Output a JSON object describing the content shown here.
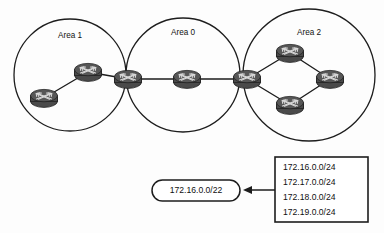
{
  "diagram": {
    "type": "network-topology",
    "title_visible": false,
    "background_color": "#fdfdfd",
    "line_color": "#1d1d1d",
    "router_color": "#4a4a4a",
    "areas": [
      {
        "id": "area-1",
        "label": "Area 1",
        "label_x": 70,
        "label_y": 36,
        "cx": 70,
        "cy": 75,
        "r": 56
      },
      {
        "id": "area-0",
        "label": "Area 0",
        "label_x": 183,
        "label_y": 33,
        "cx": 183,
        "cy": 75,
        "r": 57
      },
      {
        "id": "area-2",
        "label": "Area 2",
        "label_x": 309,
        "label_y": 33,
        "cx": 309,
        "cy": 75,
        "r": 66
      }
    ],
    "routers": [
      {
        "id": "r-a1-internal-bottom",
        "area": "Area 1",
        "x": 44,
        "y": 98
      },
      {
        "id": "r-a1-internal-top",
        "area": "Area 1",
        "x": 88,
        "y": 72
      },
      {
        "id": "r-abr-1",
        "area": "Area 1 / Area 0 border",
        "x": 128,
        "y": 79
      },
      {
        "id": "r-a0-backbone",
        "area": "Area 0",
        "x": 187,
        "y": 79
      },
      {
        "id": "r-abr-2",
        "area": "Area 0 / Area 2 border",
        "x": 247,
        "y": 79
      },
      {
        "id": "r-a2-top",
        "area": "Area 2",
        "x": 290,
        "y": 53
      },
      {
        "id": "r-a2-right",
        "area": "Area 2",
        "x": 330,
        "y": 79
      },
      {
        "id": "r-a2-bottom",
        "area": "Area 2",
        "x": 290,
        "y": 105
      }
    ],
    "links": [
      {
        "id": "link-a1-bottom-top",
        "from": "r-a1-internal-bottom",
        "to": "r-a1-internal-top"
      },
      {
        "id": "link-a1-top-abr1",
        "from": "r-a1-internal-top",
        "to": "r-abr-1"
      },
      {
        "id": "link-abr1-backbone",
        "from": "r-abr-1",
        "to": "r-a0-backbone"
      },
      {
        "id": "link-backbone-abr2",
        "from": "r-a0-backbone",
        "to": "r-abr-2"
      },
      {
        "id": "link-abr2-a2top",
        "from": "r-abr-2",
        "to": "r-a2-top"
      },
      {
        "id": "link-abr2-a2bottom",
        "from": "r-abr-2",
        "to": "r-a2-bottom"
      },
      {
        "id": "link-a2top-a2right",
        "from": "r-a2-top",
        "to": "r-a2-right"
      },
      {
        "id": "link-a2bottom-a2right",
        "from": "r-a2-bottom",
        "to": "r-a2-right"
      }
    ]
  },
  "summary_route": {
    "label": "172.16.0.0/22",
    "x": 152,
    "y": 180,
    "width": 88,
    "height": 21
  },
  "subnet_list": {
    "x": 275,
    "y": 157,
    "width": 93,
    "height": 65,
    "entries": [
      "172.16.0.0/24",
      "172.17.0.0/24",
      "172.18.0.0/24",
      "172.19.0.0/24"
    ]
  },
  "arrow": {
    "direction": "left",
    "from_x": 275,
    "to_x": 243,
    "y": 190
  }
}
